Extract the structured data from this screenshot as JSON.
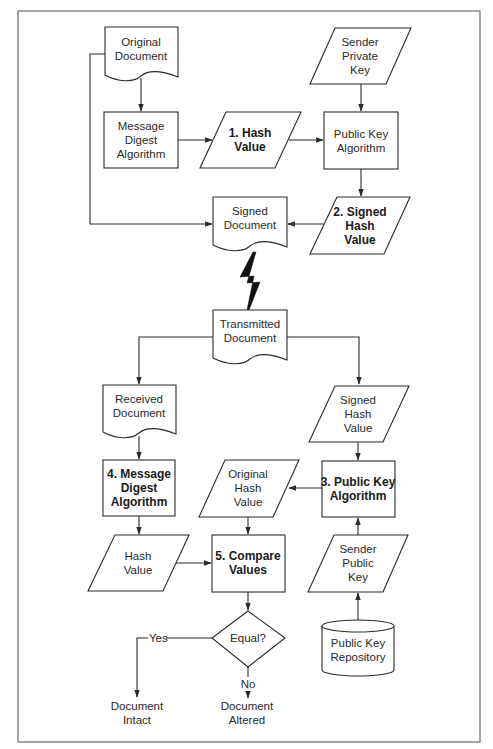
{
  "diagram": {
    "nodes": {
      "original_document": {
        "lines": [
          "Original",
          "Document"
        ],
        "shape": "document"
      },
      "message_digest_algorithm": {
        "lines": [
          "Message",
          "Digest",
          "Algorithm"
        ],
        "shape": "process"
      },
      "hash_value_1": {
        "lines": [
          "1. Hash",
          "Value"
        ],
        "shape": "data",
        "bold": true
      },
      "sender_private_key": {
        "lines": [
          "Sender",
          "Private",
          "Key"
        ],
        "shape": "data"
      },
      "public_key_algorithm": {
        "lines": [
          "Public Key",
          "Algorithm"
        ],
        "shape": "process"
      },
      "signed_hash_value_2": {
        "lines": [
          "2. Signed",
          "Hash",
          "Value"
        ],
        "shape": "data",
        "bold": true
      },
      "signed_document": {
        "lines": [
          "Signed",
          "Document"
        ],
        "shape": "document"
      },
      "transmitted_document": {
        "lines": [
          "Transmitted",
          "Document"
        ],
        "shape": "document"
      },
      "received_document": {
        "lines": [
          "Received",
          "Document"
        ],
        "shape": "document"
      },
      "signed_hash_value_received": {
        "lines": [
          "Signed",
          "Hash",
          "Value"
        ],
        "shape": "data"
      },
      "message_digest_algorithm_4": {
        "lines": [
          "4. Message",
          "Digest",
          "Algorithm"
        ],
        "shape": "process",
        "bold": true
      },
      "original_hash_value": {
        "lines": [
          "Original",
          "Hash",
          "Value"
        ],
        "shape": "data"
      },
      "public_key_algorithm_3": {
        "lines": [
          "3. Public Key",
          "Algorithm"
        ],
        "shape": "process",
        "bold": true
      },
      "hash_value": {
        "lines": [
          "Hash",
          "Value"
        ],
        "shape": "data"
      },
      "compare_values_5": {
        "lines": [
          "5. Compare",
          "Values"
        ],
        "shape": "process",
        "bold": true
      },
      "sender_public_key": {
        "lines": [
          "Sender",
          "Public",
          "Key"
        ],
        "shape": "data"
      },
      "equal_decision": {
        "lines": [
          "Equal?"
        ],
        "shape": "decision"
      },
      "public_key_repository": {
        "lines": [
          "Public Key",
          "Repository"
        ],
        "shape": "database"
      },
      "document_intact": {
        "lines": [
          "Document",
          "Intact"
        ],
        "shape": "terminal-text"
      },
      "document_altered": {
        "lines": [
          "Document",
          "Altered"
        ],
        "shape": "terminal-text"
      }
    },
    "edge_labels": {
      "yes": "Yes",
      "no": "No"
    },
    "edges": [
      [
        "original_document",
        "message_digest_algorithm"
      ],
      [
        "message_digest_algorithm",
        "hash_value_1"
      ],
      [
        "hash_value_1",
        "public_key_algorithm"
      ],
      [
        "sender_private_key",
        "public_key_algorithm"
      ],
      [
        "public_key_algorithm",
        "signed_hash_value_2"
      ],
      [
        "signed_hash_value_2",
        "signed_document"
      ],
      [
        "original_document",
        "signed_document"
      ],
      [
        "signed_document",
        "transmitted_document",
        "transmission"
      ],
      [
        "transmitted_document",
        "received_document"
      ],
      [
        "transmitted_document",
        "signed_hash_value_received"
      ],
      [
        "received_document",
        "message_digest_algorithm_4"
      ],
      [
        "message_digest_algorithm_4",
        "hash_value"
      ],
      [
        "signed_hash_value_received",
        "public_key_algorithm_3"
      ],
      [
        "public_key_repository",
        "sender_public_key"
      ],
      [
        "sender_public_key",
        "public_key_algorithm_3"
      ],
      [
        "public_key_algorithm_3",
        "original_hash_value"
      ],
      [
        "original_hash_value",
        "compare_values_5"
      ],
      [
        "hash_value",
        "compare_values_5"
      ],
      [
        "compare_values_5",
        "equal_decision"
      ],
      [
        "equal_decision",
        "document_intact",
        "Yes"
      ],
      [
        "equal_decision",
        "document_altered",
        "No"
      ]
    ]
  }
}
